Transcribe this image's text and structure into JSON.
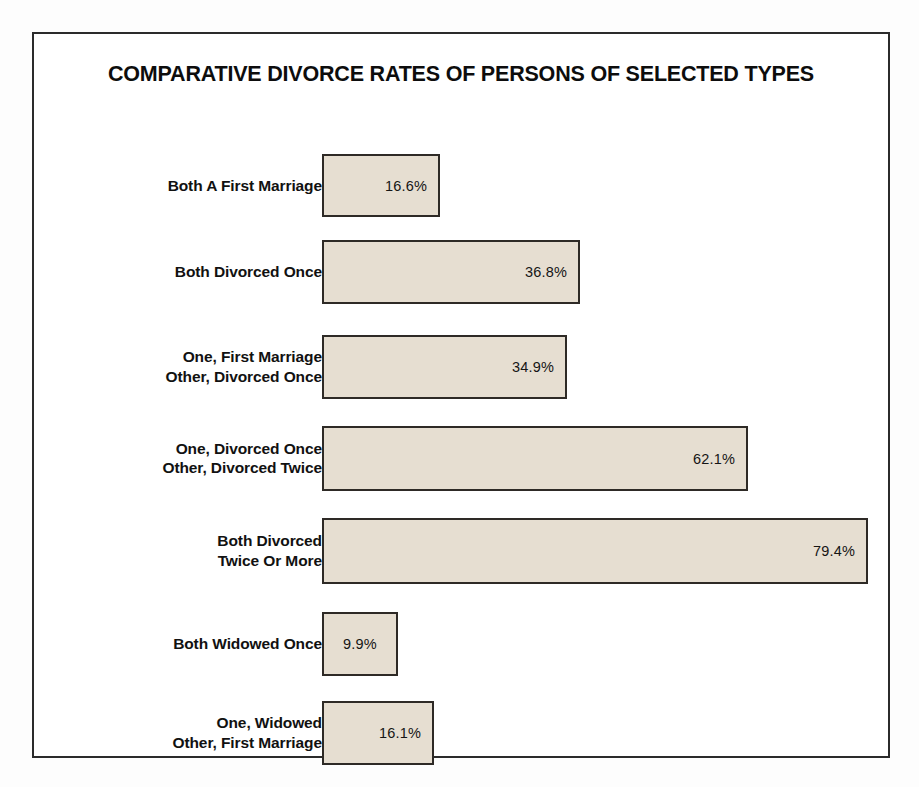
{
  "chart_data": {
    "type": "bar",
    "orientation": "horizontal",
    "title": "COMPARATIVE DIVORCE RATES OF PERSONS OF SELECTED TYPES",
    "xlabel": "",
    "ylabel": "",
    "xlim": [
      0,
      80
    ],
    "grid": false,
    "legend": null,
    "unit": "%",
    "categories": [
      "Both A First Marriage",
      "Both Divorced Once",
      "One, First Marriage\nOther, Divorced Once",
      "One, Divorced Once\nOther, Divorced Twice",
      "Both Divorced\nTwice Or More",
      "Both Widowed Once",
      "One, Widowed\nOther, First Marriage"
    ],
    "values": [
      16.6,
      36.8,
      34.9,
      62.1,
      79.4,
      9.9,
      16.1
    ],
    "value_labels": [
      "16.6%",
      "36.8%",
      "34.9%",
      "62.1%",
      "79.4%",
      "9.9%",
      "16.1%"
    ],
    "bars": [
      {
        "label": "Both A First Marriage",
        "value": 16.6,
        "value_label": "16.6%",
        "width_px": 118,
        "top_px": 42,
        "height_px": 63,
        "value_align": "right"
      },
      {
        "label": "Both Divorced Once",
        "value": 36.8,
        "value_label": "36.8%",
        "width_px": 258,
        "top_px": 128,
        "height_px": 64,
        "value_align": "right"
      },
      {
        "label": "One, First Marriage\nOther, Divorced Once",
        "value": 34.9,
        "value_label": "34.9%",
        "width_px": 245,
        "top_px": 223,
        "height_px": 64,
        "value_align": "right"
      },
      {
        "label": "One, Divorced Once\nOther, Divorced Twice",
        "value": 62.1,
        "value_label": "62.1%",
        "width_px": 426,
        "top_px": 314,
        "height_px": 65,
        "value_align": "right"
      },
      {
        "label": "Both Divorced\nTwice Or More",
        "value": 79.4,
        "value_label": "79.4%",
        "width_px": 546,
        "top_px": 406,
        "height_px": 66,
        "value_align": "right"
      },
      {
        "label": "Both Widowed Once",
        "value": 9.9,
        "value_label": "9.9%",
        "width_px": 76,
        "top_px": 500,
        "height_px": 64,
        "value_align": "center"
      },
      {
        "label": "One, Widowed\nOther, First Marriage",
        "value": 16.1,
        "value_label": "16.1%",
        "width_px": 112,
        "top_px": 589,
        "height_px": 64,
        "value_align": "right"
      }
    ],
    "colors": {
      "bar_fill": "#e6ded1",
      "bar_border": "#2e2a26",
      "frame_border": "#2b2b2b",
      "background": "#ffffff",
      "page_background": "#fdfdfd",
      "text": "#111111"
    }
  }
}
